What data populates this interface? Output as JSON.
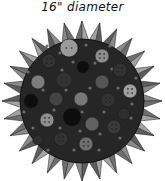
{
  "caption": "16\" diameter",
  "mat": {
    "cx": 82,
    "cy": 101,
    "r": 62,
    "fill": "#262626",
    "spike_outer_r": 80,
    "spike_count": 28,
    "spike_colors": [
      "#8a8a8a",
      "#6e6e6e",
      "#a3a3a3",
      "#5c5c5c"
    ]
  },
  "buttons": [
    {
      "x": 69,
      "y": 48,
      "r": 9,
      "fill": "#9a9a9a",
      "holes": 2
    },
    {
      "x": 102,
      "y": 56,
      "r": 7,
      "fill": "#8c8c8c",
      "holes": 4
    },
    {
      "x": 49,
      "y": 61,
      "r": 7,
      "fill": "#333333",
      "holes": 4
    },
    {
      "x": 83,
      "y": 67,
      "r": 6,
      "fill": "#0d0d0d",
      "holes": 0
    },
    {
      "x": 120,
      "y": 70,
      "r": 7,
      "fill": "#333333",
      "holes": 4
    },
    {
      "x": 38,
      "y": 82,
      "r": 7,
      "fill": "#7d7d7d",
      "holes": 0
    },
    {
      "x": 64,
      "y": 80,
      "r": 8,
      "fill": "#333333",
      "holes": 4
    },
    {
      "x": 102,
      "y": 82,
      "r": 7,
      "fill": "#555555",
      "holes": 0
    },
    {
      "x": 130,
      "y": 91,
      "r": 7,
      "fill": "#a0a0a0",
      "holes": 4
    },
    {
      "x": 31,
      "y": 101,
      "r": 7,
      "fill": "#0d0d0d",
      "holes": 0
    },
    {
      "x": 56,
      "y": 99,
      "r": 7,
      "fill": "#444444",
      "holes": 0
    },
    {
      "x": 81,
      "y": 99,
      "r": 7,
      "fill": "#777777",
      "holes": 0
    },
    {
      "x": 108,
      "y": 100,
      "r": 7,
      "fill": "#333333",
      "holes": 4
    },
    {
      "x": 47,
      "y": 120,
      "r": 7,
      "fill": "#8f8f8f",
      "holes": 4
    },
    {
      "x": 72,
      "y": 117,
      "r": 9,
      "fill": "#0d0d0d",
      "holes": 0
    },
    {
      "x": 92,
      "y": 124,
      "r": 7,
      "fill": "#606060",
      "holes": 0
    },
    {
      "x": 114,
      "y": 127,
      "r": 7,
      "fill": "#3a3a3a",
      "holes": 4
    },
    {
      "x": 61,
      "y": 139,
      "r": 7,
      "fill": "#333333",
      "holes": 4
    },
    {
      "x": 86,
      "y": 144,
      "r": 7,
      "fill": "#6e6e6e",
      "holes": 4
    },
    {
      "x": 124,
      "y": 114,
      "r": 6,
      "fill": "#2e2e2e",
      "holes": 0
    },
    {
      "x": 38,
      "y": 140,
      "r": 5,
      "fill": "#2e2e2e",
      "holes": 0
    }
  ],
  "dots": [
    [
      47,
      46
    ],
    [
      60,
      53
    ],
    [
      86,
      45
    ],
    [
      110,
      46
    ],
    [
      62,
      70
    ],
    [
      73,
      62
    ],
    [
      95,
      63
    ],
    [
      112,
      69
    ],
    [
      136,
      78
    ],
    [
      28,
      72
    ],
    [
      43,
      90
    ],
    [
      66,
      90
    ],
    [
      90,
      88
    ],
    [
      118,
      88
    ],
    [
      132,
      104
    ],
    [
      24,
      112
    ],
    [
      54,
      110
    ],
    [
      82,
      112
    ],
    [
      104,
      112
    ],
    [
      131,
      118
    ],
    [
      33,
      128
    ],
    [
      60,
      128
    ],
    [
      80,
      131
    ],
    [
      100,
      134
    ],
    [
      120,
      138
    ],
    [
      48,
      150
    ],
    [
      74,
      150
    ],
    [
      99,
      150
    ]
  ],
  "dot_fill": "#6a6a6a"
}
